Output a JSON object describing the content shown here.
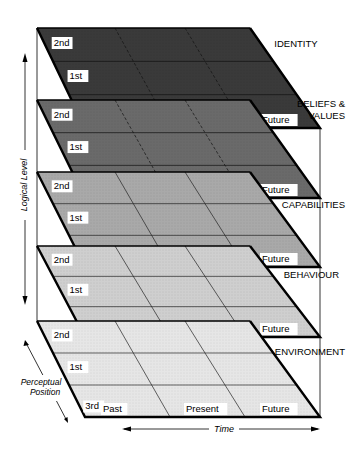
{
  "diagram": {
    "axes": {
      "vertical": {
        "label": "Logical Level"
      },
      "depth": {
        "label_line1": "Perceptual",
        "label_line2": "Position"
      },
      "horizontal": {
        "label": "Time"
      }
    },
    "layers": [
      {
        "name": "IDENTITY",
        "label_lines": [
          "IDENTITY"
        ],
        "fill": "#3a3a3a"
      },
      {
        "name": "BELIEFS & VALUES",
        "label_lines": [
          "BELIEFS &",
          "VALUES"
        ],
        "fill": "#6a6a6a"
      },
      {
        "name": "CAPABILITIES",
        "label_lines": [
          "CAPABILITIES"
        ],
        "fill": "#a9a9a9"
      },
      {
        "name": "BEHAVIOUR",
        "label_lines": [
          "BEHAVIOUR"
        ],
        "fill": "#cfcfcf"
      },
      {
        "name": "ENVIRONMENT",
        "label_lines": [
          "ENVIRONMENT"
        ],
        "fill": "#e6e6e6"
      }
    ],
    "positions": [
      "2nd",
      "1st",
      "3rd"
    ],
    "time_labels": [
      "Past",
      "Present",
      "Future"
    ]
  }
}
